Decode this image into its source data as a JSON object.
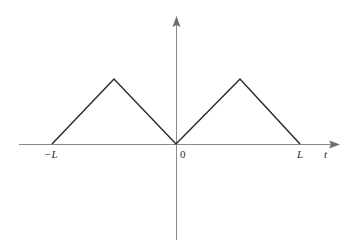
{
  "figure": {
    "background_color": "#ffffff",
    "width": 357,
    "height": 248
  },
  "axes": {
    "x_axis": {
      "name": "t",
      "label": "t",
      "color": "#8a8a8a",
      "arrow_direction": "right",
      "start_px": 19,
      "end_px": 340,
      "y_px": 144
    },
    "y_axis": {
      "label": "",
      "color": "#8a8a8a",
      "arrow_direction": "up",
      "top_px": 16,
      "bottom_px": 240,
      "x_px": 176
    }
  },
  "tick_labels": {
    "neg_l": "−L",
    "zero": "0",
    "pos_l": "L",
    "t_axis": "t"
  },
  "chart_data": {
    "type": "line",
    "title": "",
    "subtitle": "",
    "xlabel": "t",
    "ylabel": "",
    "grid": false,
    "legend": false,
    "legend_position": "none",
    "xlim": [
      -1.35,
      1.45
    ],
    "ylim": [
      -0.85,
      1.35
    ],
    "xticks": [
      -1,
      0,
      1
    ],
    "xticklabels": [
      "−L",
      "0",
      "L"
    ],
    "yticks": [],
    "yticklabels": [],
    "annotations": [],
    "series": [
      {
        "name": "triangular wave",
        "color": "#2b2b2b",
        "linewidth": 1.5,
        "x": [
          -1,
          -0.5,
          0,
          0.5,
          1
        ],
        "y": [
          0,
          1,
          0,
          1,
          0
        ],
        "x_px": [
          52,
          114,
          176,
          240,
          300
        ],
        "y_px": [
          144,
          79,
          144,
          79,
          144
        ],
        "description": "Full-wave rectified triangular waveform: zero at t = -L, peak at t = -L/2, zero at t = 0, peak at t = L/2, zero at t = L"
      }
    ]
  }
}
